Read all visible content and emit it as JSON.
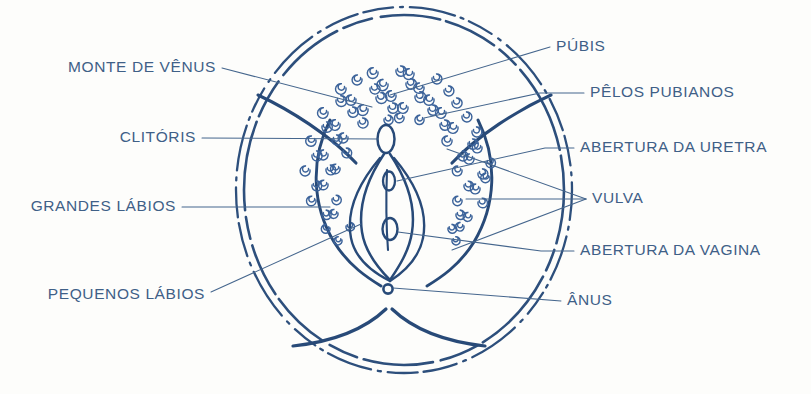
{
  "diagram": {
    "language": "pt-BR",
    "ink_color": "#2d4f7c",
    "text_color": "#3f6087",
    "leader_color": "#45668d",
    "background_color": "#fdfdfb"
  },
  "labels_left": [
    {
      "id": "monte-de-venus",
      "text": "MONTE DE VÊNUS",
      "x": 216,
      "y": 72
    },
    {
      "id": "clitoris",
      "text": "CLITÓRIS",
      "x": 196,
      "y": 142
    },
    {
      "id": "grandes-labios",
      "text": "GRANDES LÁBIOS",
      "x": 176,
      "y": 211
    },
    {
      "id": "pequenos-labios",
      "text": "PEQUENOS LÁBIOS",
      "x": 205,
      "y": 299
    }
  ],
  "labels_right": [
    {
      "id": "pubis",
      "text": "PÚBIS",
      "x": 556,
      "y": 51
    },
    {
      "id": "pelos-pubianos",
      "text": "PÊLOS PUBIANOS",
      "x": 590,
      "y": 97
    },
    {
      "id": "abertura-da-uretra",
      "text": "ABERTURA DA URETRA",
      "x": 580,
      "y": 152
    },
    {
      "id": "vulva",
      "text": "VULVA",
      "x": 592,
      "y": 203
    },
    {
      "id": "abertura-da-vagina",
      "text": "ABERTURA DA VAGINA",
      "x": 580,
      "y": 255
    },
    {
      "id": "anus",
      "text": "ÂNUS",
      "x": 567,
      "y": 305
    }
  ],
  "anatomy_parts": [
    "pubic-mound",
    "pubic-hair",
    "clitoris",
    "urethral-opening",
    "labia-majora",
    "labia-minora",
    "vaginal-opening",
    "anus",
    "perineum",
    "buttock-outline"
  ]
}
